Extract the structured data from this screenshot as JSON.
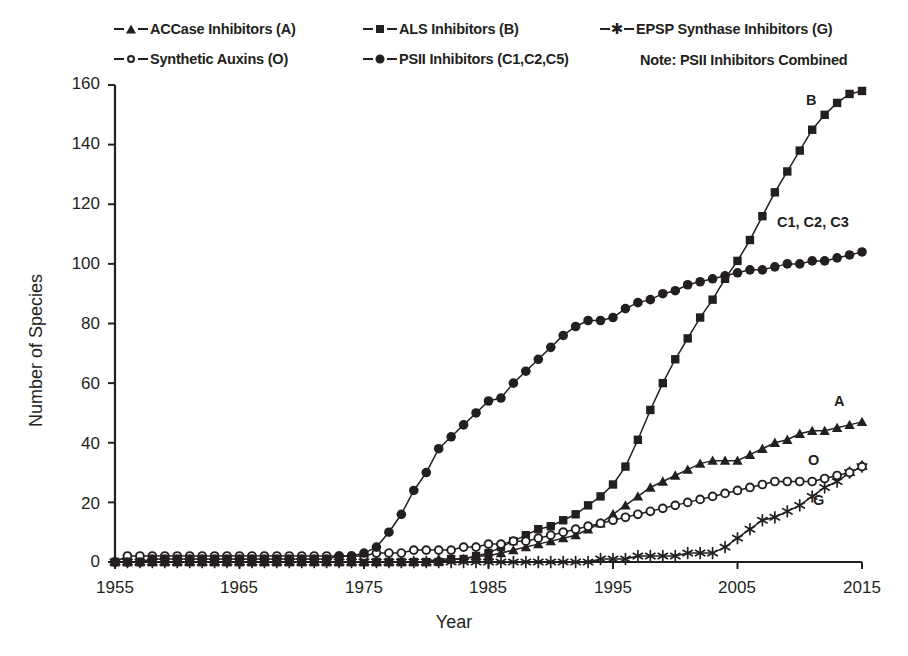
{
  "chart_data": {
    "type": "line",
    "title": "",
    "xlabel": "Year",
    "ylabel": "Number of Species",
    "xlim": [
      1955,
      2015
    ],
    "ylim": [
      0,
      160
    ],
    "xticks": [
      1955,
      1965,
      1975,
      1985,
      1995,
      2005,
      2015
    ],
    "yticks": [
      0,
      20,
      40,
      60,
      80,
      100,
      120,
      140,
      160
    ],
    "grid": false,
    "legend_position": "top",
    "note": "Note: PSII Inhibitors Combined",
    "x": [
      1955,
      1956,
      1957,
      1958,
      1959,
      1960,
      1961,
      1962,
      1963,
      1964,
      1965,
      1966,
      1967,
      1968,
      1969,
      1970,
      1971,
      1972,
      1973,
      1974,
      1975,
      1976,
      1977,
      1978,
      1979,
      1980,
      1981,
      1982,
      1983,
      1984,
      1985,
      1986,
      1987,
      1988,
      1989,
      1990,
      1991,
      1992,
      1993,
      1994,
      1995,
      1996,
      1997,
      1998,
      1999,
      2000,
      2001,
      2002,
      2003,
      2004,
      2005,
      2006,
      2007,
      2008,
      2009,
      2010,
      2011,
      2012,
      2013,
      2014,
      2015
    ],
    "series": [
      {
        "name": "ACCase Inhibitors (A)",
        "marker": "triangle",
        "annotation": "A",
        "values": [
          0,
          0,
          0,
          0,
          0,
          0,
          0,
          0,
          0,
          0,
          0,
          0,
          0,
          0,
          0,
          0,
          0,
          0,
          0,
          0,
          0,
          0,
          0,
          0,
          0,
          0,
          1,
          1,
          1,
          2,
          2,
          3,
          4,
          5,
          6,
          7,
          8,
          9,
          11,
          13,
          16,
          19,
          22,
          25,
          27,
          29,
          31,
          33,
          34,
          34,
          34,
          36,
          38,
          40,
          41,
          43,
          44,
          44,
          45,
          46,
          47
        ]
      },
      {
        "name": "ALS Inhibitors (B)",
        "marker": "square",
        "annotation": "B",
        "values": [
          0,
          0,
          0,
          0,
          0,
          0,
          0,
          0,
          0,
          0,
          0,
          0,
          0,
          0,
          0,
          0,
          0,
          0,
          0,
          0,
          0,
          0,
          0,
          0,
          0,
          0,
          0,
          1,
          1,
          2,
          3,
          5,
          7,
          9,
          11,
          12,
          14,
          16,
          19,
          22,
          26,
          32,
          41,
          51,
          60,
          68,
          75,
          82,
          88,
          95,
          101,
          108,
          116,
          124,
          131,
          138,
          145,
          150,
          154,
          157,
          158
        ]
      },
      {
        "name": "EPSP Synthase Inhibitors (G)",
        "marker": "star",
        "annotation": "G",
        "values": [
          0,
          0,
          0,
          0,
          0,
          0,
          0,
          0,
          0,
          0,
          0,
          0,
          0,
          0,
          0,
          0,
          0,
          0,
          0,
          0,
          0,
          0,
          0,
          0,
          0,
          0,
          0,
          0,
          0,
          0,
          0,
          0,
          0,
          0,
          0,
          0,
          0,
          0,
          0,
          1,
          1,
          1,
          2,
          2,
          2,
          2,
          3,
          3,
          3,
          5,
          8,
          11,
          14,
          15,
          17,
          19,
          22,
          25,
          27,
          30,
          32
        ]
      },
      {
        "name": "Synthetic Auxins (O)",
        "marker": "circle-open",
        "annotation": "O",
        "values": [
          0,
          2,
          2,
          2,
          2,
          2,
          2,
          2,
          2,
          2,
          2,
          2,
          2,
          2,
          2,
          2,
          2,
          2,
          2,
          2,
          2,
          3,
          3,
          3,
          4,
          4,
          4,
          4,
          5,
          5,
          6,
          6,
          7,
          7,
          8,
          9,
          10,
          11,
          12,
          13,
          14,
          15,
          16,
          17,
          18,
          19,
          20,
          21,
          22,
          23,
          24,
          25,
          26,
          27,
          27,
          27,
          27,
          28,
          29,
          30,
          32
        ]
      },
      {
        "name": "PSII Inhibitors (C1,C2,C5)",
        "marker": "circle-filled",
        "annotation": "C1, C2, C3",
        "values": [
          0,
          0,
          0,
          1,
          1,
          1,
          1,
          1,
          1,
          1,
          1,
          1,
          1,
          1,
          1,
          1,
          1,
          1,
          2,
          2,
          3,
          5,
          10,
          16,
          24,
          30,
          38,
          42,
          46,
          50,
          54,
          55,
          60,
          64,
          68,
          72,
          76,
          79,
          81,
          81,
          82,
          85,
          87,
          88,
          90,
          91,
          93,
          94,
          95,
          96,
          97,
          98,
          98,
          99,
          100,
          100,
          101,
          101,
          102,
          103,
          104
        ]
      }
    ]
  },
  "legend": {
    "items": [
      {
        "label": "ACCase Inhibitors (A)",
        "marker": "triangle"
      },
      {
        "label": "ALS Inhibitors (B)",
        "marker": "square"
      },
      {
        "label": "EPSP Synthase Inhibitors (G)",
        "marker": "star"
      },
      {
        "label": "Synthetic Auxins (O)",
        "marker": "circle-open"
      },
      {
        "label": "PSII Inhibitors (C1,C2,C5)",
        "marker": "circle-filled"
      }
    ],
    "note": "Note: PSII Inhibitors Combined"
  },
  "axes": {
    "y_title": "Number of Species",
    "x_title": "Year",
    "y_tick_labels": [
      "160",
      "140",
      "120",
      "100",
      "80",
      "60",
      "40",
      "20",
      "0"
    ],
    "x_tick_labels": [
      "1955",
      "1965",
      "1975",
      "1985",
      "1995",
      "2005",
      "2015"
    ]
  },
  "annotations": {
    "a": "A",
    "b": "B",
    "g": "G",
    "o": "O",
    "c": "C1, C2, C3"
  },
  "colors": {
    "ink": "#231f20",
    "background": "#ffffff"
  }
}
